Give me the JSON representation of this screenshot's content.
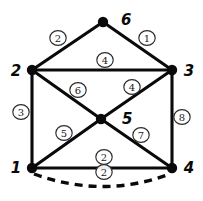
{
  "diagram": {
    "type": "weighted-graph",
    "ink_color": "#0a0a0a",
    "background_color": "#ffffff",
    "vertices": [
      {
        "id": "v6",
        "label": "6",
        "x": 103,
        "y": 22,
        "label_x": 121,
        "label_y": 20
      },
      {
        "id": "v2",
        "label": "2",
        "x": 32,
        "y": 70,
        "label_x": 14,
        "label_y": 71
      },
      {
        "id": "v3",
        "label": "3",
        "x": 172,
        "y": 70,
        "label_x": 190,
        "label_y": 71
      },
      {
        "id": "v5",
        "label": "5",
        "x": 101,
        "y": 119,
        "label_x": 122,
        "label_y": 119
      },
      {
        "id": "v1",
        "label": "1",
        "x": 32,
        "y": 168,
        "label_x": 14,
        "label_y": 168
      },
      {
        "id": "v4",
        "label": "4",
        "x": 172,
        "y": 168,
        "label_x": 190,
        "label_y": 168
      }
    ],
    "edges": [
      {
        "id": "e-2-6",
        "from": "v2",
        "to": "v6",
        "weight": "2",
        "style": "solid",
        "label_x": 58,
        "label_y": 38
      },
      {
        "id": "e-6-3",
        "from": "v6",
        "to": "v3",
        "weight": "1",
        "style": "solid",
        "label_x": 147,
        "label_y": 38
      },
      {
        "id": "e-2-3",
        "from": "v2",
        "to": "v3",
        "weight": "4",
        "style": "solid",
        "label_x": 105,
        "label_y": 60
      },
      {
        "id": "e-2-5",
        "from": "v2",
        "to": "v5",
        "weight": "6",
        "style": "solid",
        "label_x": 78,
        "label_y": 90
      },
      {
        "id": "e-5-3",
        "from": "v5",
        "to": "v3",
        "weight": "4",
        "style": "solid",
        "label_x": 132,
        "label_y": 87
      },
      {
        "id": "e-2-1",
        "from": "v2",
        "to": "v1",
        "weight": "3",
        "style": "solid",
        "label_x": 21,
        "label_y": 112
      },
      {
        "id": "e-3-4",
        "from": "v3",
        "to": "v4",
        "weight": "8",
        "style": "solid",
        "label_x": 182,
        "label_y": 117
      },
      {
        "id": "e-1-5",
        "from": "v1",
        "to": "v5",
        "weight": "5",
        "style": "solid",
        "label_x": 64,
        "label_y": 133
      },
      {
        "id": "e-5-4",
        "from": "v5",
        "to": "v4",
        "weight": "7",
        "style": "solid",
        "label_x": 141,
        "label_y": 135
      },
      {
        "id": "e-1-4",
        "from": "v1",
        "to": "v4",
        "weight": "2",
        "style": "solid",
        "label_x": 104,
        "label_y": 157
      },
      {
        "id": "e-1-4-arc",
        "from": "v1",
        "to": "v4",
        "weight": "2",
        "style": "dashed",
        "label_x": 104,
        "label_y": 172
      }
    ]
  }
}
